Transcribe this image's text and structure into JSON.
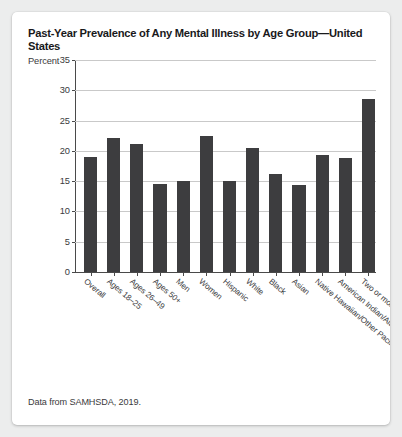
{
  "card": {
    "title": "Past-Year Prevalence of Any Mental Illness by Age Group—United States",
    "source_note": "Data from SAMHSDA, 2019."
  },
  "chart_data": {
    "type": "bar",
    "title": "Past-Year Prevalence of Any Mental Illness by Age Group—United States",
    "xlabel": "",
    "ylabel": "Percent",
    "ylim": [
      0,
      35
    ],
    "yticks": [
      0,
      5,
      10,
      15,
      20,
      25,
      30,
      35
    ],
    "grid": true,
    "legend": false,
    "bar_color": "#3d3d3f",
    "categories": [
      "Overall",
      "Ages 18–25",
      "Ages 26–49",
      "Ages 50+",
      "Men",
      "Women",
      "Hispanic",
      "White",
      "Black",
      "Asian",
      "Native Hawaiian/Other Pacific Islander",
      "American Indian/Alaskan Native",
      "Two or more ethnicities"
    ],
    "values": [
      19.0,
      22.2,
      21.1,
      14.5,
      15.1,
      22.4,
      15.1,
      20.4,
      16.2,
      14.4,
      19.4,
      18.8,
      28.6
    ],
    "annotation": "Data from SAMHSDA, 2019."
  }
}
